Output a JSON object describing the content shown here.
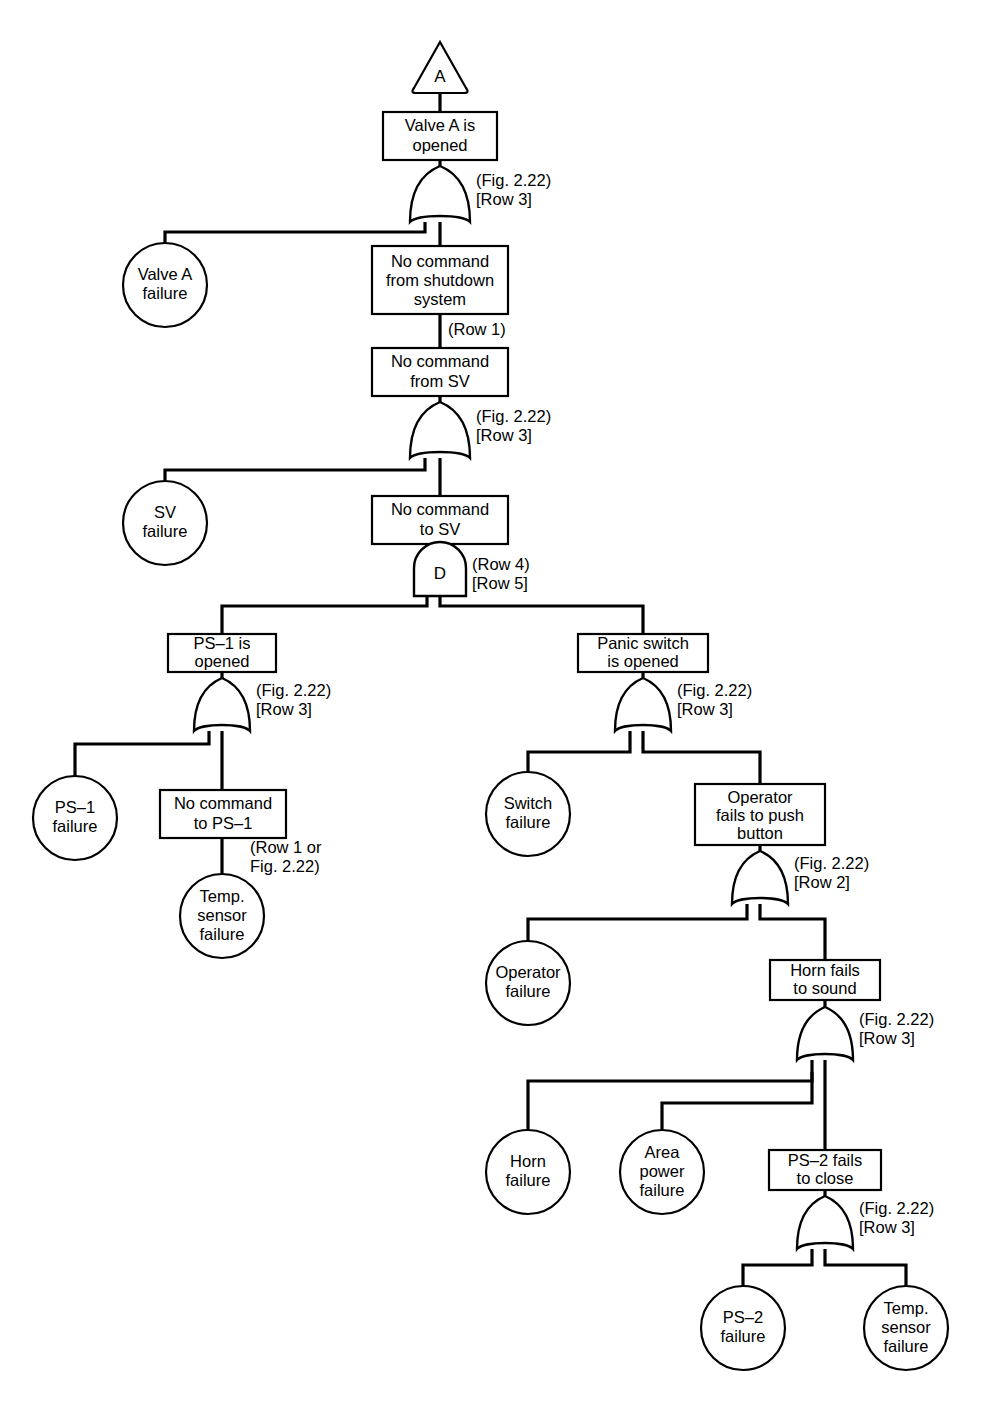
{
  "diagram": {
    "type": "fault-tree",
    "transfer_in": {
      "id": "transfer-a",
      "label": "A"
    },
    "events": [
      {
        "id": "valve-a-is-opened",
        "kind": "box",
        "lines": [
          "Valve A is",
          "opened"
        ]
      },
      {
        "id": "valve-a-failure",
        "kind": "circle",
        "lines": [
          "Valve A",
          "failure"
        ]
      },
      {
        "id": "no-command-from-shutdown-system",
        "kind": "box",
        "lines": [
          "No command",
          "from shutdown",
          "system"
        ]
      },
      {
        "id": "no-command-from-sv",
        "kind": "box",
        "lines": [
          "No command",
          "from SV"
        ]
      },
      {
        "id": "sv-failure",
        "kind": "circle",
        "lines": [
          "SV",
          "failure"
        ]
      },
      {
        "id": "no-command-to-sv",
        "kind": "box",
        "lines": [
          "No command",
          "to SV"
        ]
      },
      {
        "id": "ps-1-is-opened",
        "kind": "box",
        "lines": [
          "PS–1 is",
          "opened"
        ]
      },
      {
        "id": "ps-1-failure",
        "kind": "circle",
        "lines": [
          "PS–1",
          "failure"
        ]
      },
      {
        "id": "no-command-to-ps-1",
        "kind": "box",
        "lines": [
          "No command",
          "to PS–1"
        ]
      },
      {
        "id": "temp-sensor-failure-1",
        "kind": "circle",
        "lines": [
          "Temp.",
          "sensor",
          "failure"
        ]
      },
      {
        "id": "panic-switch-is-opened",
        "kind": "box",
        "lines": [
          "Panic switch",
          "is opened"
        ]
      },
      {
        "id": "switch-failure",
        "kind": "circle",
        "lines": [
          "Switch",
          "failure"
        ]
      },
      {
        "id": "operator-fails-to-push-button",
        "kind": "box",
        "lines": [
          "Operator",
          "fails to push",
          "button"
        ]
      },
      {
        "id": "operator-failure",
        "kind": "circle",
        "lines": [
          "Operator",
          "failure"
        ]
      },
      {
        "id": "horn-fails-to-sound",
        "kind": "box",
        "lines": [
          "Horn fails",
          "to sound"
        ]
      },
      {
        "id": "horn-failure",
        "kind": "circle",
        "lines": [
          "Horn",
          "failure"
        ]
      },
      {
        "id": "area-power-failure",
        "kind": "circle",
        "lines": [
          "Area",
          "power",
          "failure"
        ]
      },
      {
        "id": "ps-2-fails-to-close",
        "kind": "box",
        "lines": [
          "PS–2 fails",
          "to close"
        ]
      },
      {
        "id": "ps-2-failure",
        "kind": "circle",
        "lines": [
          "PS–2",
          "failure"
        ]
      },
      {
        "id": "temp-sensor-failure-2",
        "kind": "circle",
        "lines": [
          "Temp.",
          "sensor",
          "failure"
        ]
      }
    ],
    "gates": [
      {
        "id": "gate-valve-a",
        "type": "OR",
        "symbol": "",
        "notes": [
          "(Fig. 2.22)",
          "[Row 3]"
        ]
      },
      {
        "id": "gate-no-cmd-from-sv",
        "type": "OR",
        "symbol": "",
        "notes": [
          "(Fig. 2.22)",
          "[Row 3]"
        ]
      },
      {
        "id": "gate-no-cmd-to-sv",
        "type": "AND",
        "symbol": "D",
        "notes": [
          "(Row 4)",
          "[Row 5]"
        ]
      },
      {
        "id": "gate-ps-1",
        "type": "OR",
        "symbol": "",
        "notes": [
          "(Fig. 2.22)",
          "[Row 3]"
        ]
      },
      {
        "id": "gate-panic-switch",
        "type": "OR",
        "symbol": "",
        "notes": [
          "(Fig. 2.22)",
          "[Row 3]"
        ]
      },
      {
        "id": "gate-operator",
        "type": "OR",
        "symbol": "",
        "notes": [
          "(Fig. 2.22)",
          "[Row 2]"
        ]
      },
      {
        "id": "gate-horn",
        "type": "OR",
        "symbol": "",
        "notes": [
          "(Fig. 2.22)",
          "[Row 3]"
        ]
      },
      {
        "id": "gate-ps-2",
        "type": "OR",
        "symbol": "",
        "notes": [
          "(Fig. 2.22)",
          "[Row 3]"
        ]
      }
    ],
    "edge_notes": [
      {
        "id": "note-row-1",
        "text": "(Row 1)"
      },
      {
        "id": "note-row1-or-fig222",
        "lines": [
          "(Row 1 or",
          "Fig. 2.22)"
        ]
      }
    ],
    "colors": {
      "line": "#000000",
      "fill": "#ffffff",
      "text": "#000000"
    }
  }
}
